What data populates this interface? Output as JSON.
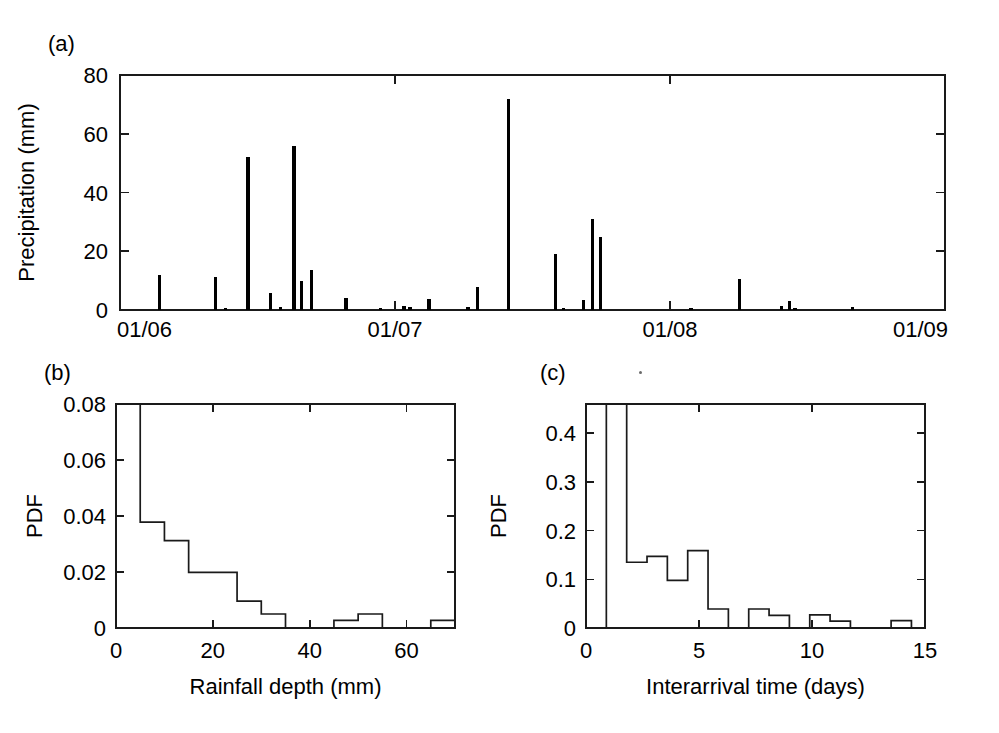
{
  "figure": {
    "background_color": "#ffffff",
    "ink_color": "#000000",
    "panel_letters": {
      "a": "(a)",
      "b": "(b)",
      "c": "(c)"
    }
  },
  "chart_data": [
    {
      "id": "panel-a",
      "type": "bar",
      "title": "",
      "panel_label": "(a)",
      "xlabel": "",
      "ylabel": "Precipitation (mm)",
      "grid": false,
      "legend": "none",
      "xlim": [
        0,
        1095
      ],
      "ylim": [
        0,
        80
      ],
      "x_tick_values": [
        0,
        365,
        730,
        1095
      ],
      "x_tick_labels": [
        "01/06",
        "01/07",
        "01/08",
        "01/09"
      ],
      "y_tick_values": [
        0,
        20,
        40,
        60,
        80
      ],
      "y_tick_labels": [
        "0",
        "20",
        "40",
        "60",
        "80"
      ],
      "x_unit": "days since 01/06",
      "y_unit": "mm",
      "values": [
        {
          "x": 52,
          "y": 11.8
        },
        {
          "x": 127,
          "y": 11.4
        },
        {
          "x": 140,
          "y": 0.6
        },
        {
          "x": 170,
          "y": 52.0
        },
        {
          "x": 200,
          "y": 5.9
        },
        {
          "x": 213,
          "y": 1.0
        },
        {
          "x": 231,
          "y": 56.0
        },
        {
          "x": 241,
          "y": 9.8
        },
        {
          "x": 254,
          "y": 13.7
        },
        {
          "x": 300,
          "y": 4.2
        },
        {
          "x": 346,
          "y": 0.8
        },
        {
          "x": 377,
          "y": 1.4
        },
        {
          "x": 385,
          "y": 1.1
        },
        {
          "x": 410,
          "y": 3.7
        },
        {
          "x": 462,
          "y": 0.9
        },
        {
          "x": 474,
          "y": 8.0
        },
        {
          "x": 516,
          "y": 72.0
        },
        {
          "x": 578,
          "y": 19.0
        },
        {
          "x": 589,
          "y": 0.7
        },
        {
          "x": 615,
          "y": 3.5
        },
        {
          "x": 627,
          "y": 31.0
        },
        {
          "x": 638,
          "y": 25.0
        },
        {
          "x": 758,
          "y": 0.6
        },
        {
          "x": 822,
          "y": 10.5
        },
        {
          "x": 878,
          "y": 1.3
        },
        {
          "x": 889,
          "y": 3.2
        },
        {
          "x": 896,
          "y": 0.8
        },
        {
          "x": 972,
          "y": 0.9
        }
      ]
    },
    {
      "id": "panel-b",
      "type": "bar",
      "subtype": "histogram",
      "panel_label": "(b)",
      "title": "",
      "xlabel": "Rainfall depth (mm)",
      "ylabel": "PDF",
      "grid": false,
      "legend": "none",
      "xlim": [
        0,
        70
      ],
      "ylim": [
        0,
        0.08
      ],
      "x_tick_values": [
        0,
        20,
        40,
        60
      ],
      "x_tick_labels": [
        "0",
        "20",
        "40",
        "60"
      ],
      "y_tick_values": [
        0,
        0.02,
        0.04,
        0.06,
        0.08
      ],
      "y_tick_labels": [
        "0",
        "0.02",
        "0.04",
        "0.06",
        "0.08"
      ],
      "bin_width": 5,
      "bin_edges": [
        0,
        5,
        10,
        15,
        20,
        25,
        30,
        35,
        40,
        45,
        50,
        55,
        60,
        65,
        70
      ],
      "values": [
        0.08,
        0.0378,
        0.0312,
        0.0199,
        0.0199,
        0.0096,
        0.005,
        0.0,
        0.0,
        0.0027,
        0.005,
        0.0,
        0.0,
        0.0027
      ],
      "note_top_bar_clipped": true
    },
    {
      "id": "panel-c",
      "type": "bar",
      "subtype": "histogram",
      "panel_label": "(c)",
      "title": "",
      "xlabel": "Interarrival time (days)",
      "ylabel": "PDF",
      "grid": false,
      "legend": "none",
      "xlim": [
        0,
        15
      ],
      "ylim": [
        0,
        0.46
      ],
      "x_tick_values": [
        0,
        5,
        10,
        15
      ],
      "x_tick_labels": [
        "0",
        "5",
        "10",
        "15"
      ],
      "y_tick_values": [
        0,
        0.1,
        0.2,
        0.3,
        0.4
      ],
      "y_tick_labels": [
        "0",
        "0.1",
        "0.2",
        "0.3",
        "0.4"
      ],
      "bin_width": 0.9,
      "bin_edges": [
        0.9,
        1.8,
        2.7,
        3.6,
        4.5,
        5.4,
        6.3,
        7.2,
        8.1,
        9.0,
        9.9,
        10.8,
        11.7,
        12.6,
        13.5,
        14.4
      ],
      "values": [
        0.46,
        0.135,
        0.147,
        0.098,
        0.159,
        0.039,
        0.0,
        0.039,
        0.026,
        0.0,
        0.027,
        0.014,
        0.0,
        0.0,
        0.015
      ],
      "note_top_bar_clipped": true
    }
  ]
}
